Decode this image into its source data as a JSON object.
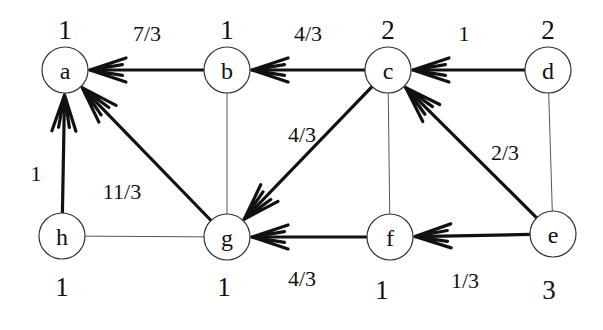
{
  "graph": {
    "nodes": [
      {
        "id": "a",
        "label": "a",
        "value": "1"
      },
      {
        "id": "b",
        "label": "b",
        "value": "1"
      },
      {
        "id": "c",
        "label": "c",
        "value": "2"
      },
      {
        "id": "d",
        "label": "d",
        "value": "2"
      },
      {
        "id": "e",
        "label": "e",
        "value": "3"
      },
      {
        "id": "f",
        "label": "f",
        "value": "1"
      },
      {
        "id": "g",
        "label": "g",
        "value": "1"
      },
      {
        "id": "h",
        "label": "h",
        "value": "1"
      }
    ],
    "directed_edges": [
      {
        "from": "b",
        "to": "a",
        "label": "7/3"
      },
      {
        "from": "c",
        "to": "b",
        "label": "4/3"
      },
      {
        "from": "d",
        "to": "c",
        "label": "1"
      },
      {
        "from": "c",
        "to": "g",
        "label": "4/3"
      },
      {
        "from": "e",
        "to": "c",
        "label": "2/3"
      },
      {
        "from": "g",
        "to": "a",
        "label": "11/3"
      },
      {
        "from": "h",
        "to": "a",
        "label": "1"
      },
      {
        "from": "f",
        "to": "g",
        "label": "4/3"
      },
      {
        "from": "e",
        "to": "f",
        "label": "1/3"
      }
    ],
    "undirected_edges": [
      {
        "from": "b",
        "to": "g"
      },
      {
        "from": "c",
        "to": "f"
      },
      {
        "from": "d",
        "to": "e"
      },
      {
        "from": "h",
        "to": "g"
      }
    ]
  }
}
